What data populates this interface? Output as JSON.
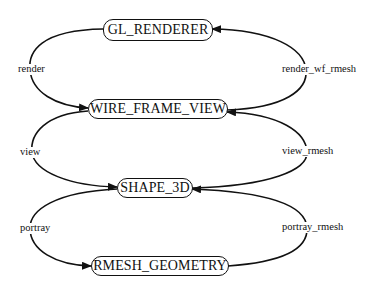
{
  "diagram": {
    "type": "state-transition",
    "nodes": [
      {
        "id": "gl_renderer",
        "label": "GL_RENDERER"
      },
      {
        "id": "wire_frame_view",
        "label": "WIRE_FRAME_VIEW"
      },
      {
        "id": "shape_3d",
        "label": "SHAPE_3D"
      },
      {
        "id": "rmesh_geometry",
        "label": "RMESH_GEOMETRY"
      }
    ],
    "edges": [
      {
        "from": "GL_RENDERER",
        "to": "WIRE_FRAME_VIEW",
        "label": "render",
        "side": "left"
      },
      {
        "from": "WIRE_FRAME_VIEW",
        "to": "GL_RENDERER",
        "label": "render_wf_rmesh",
        "side": "right"
      },
      {
        "from": "WIRE_FRAME_VIEW",
        "to": "SHAPE_3D",
        "label": "view",
        "side": "left"
      },
      {
        "from": "SHAPE_3D",
        "to": "WIRE_FRAME_VIEW",
        "label": "view_rmesh",
        "side": "right"
      },
      {
        "from": "SHAPE_3D",
        "to": "RMESH_GEOMETRY",
        "label": "portray",
        "side": "left"
      },
      {
        "from": "RMESH_GEOMETRY",
        "to": "SHAPE_3D",
        "label": "portray_rmesh",
        "side": "right"
      }
    ]
  }
}
